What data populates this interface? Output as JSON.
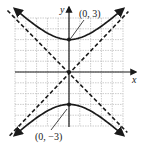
{
  "chart_data": {
    "type": "line",
    "title": "",
    "xlabel": "x",
    "ylabel": "y",
    "xlim": [
      -5,
      5
    ],
    "ylim": [
      -5,
      5
    ],
    "grid": true,
    "equation": "y^2/9 - x^2/9 = 1",
    "series": [
      {
        "name": "upper-branch",
        "style": "solid",
        "function": "y = sqrt(9 + x^2)",
        "x_range": [
          -5,
          5
        ]
      },
      {
        "name": "lower-branch",
        "style": "solid",
        "function": "y = -sqrt(9 + x^2)",
        "x_range": [
          -5,
          5
        ]
      },
      {
        "name": "asymptote-positive",
        "style": "dashed",
        "function": "y = x"
      },
      {
        "name": "asymptote-negative",
        "style": "dashed",
        "function": "y = -x"
      }
    ],
    "points": [
      {
        "label": "(0, 3)",
        "x": 0,
        "y": 3
      },
      {
        "label": "(0, -3)",
        "x": 0,
        "y": -3
      },
      {
        "label": "",
        "x": 0,
        "y": 0
      }
    ],
    "annotations": [
      "(0, 3)",
      "(0, −3)"
    ]
  },
  "labels": {
    "x_axis": "x",
    "y_axis": "y",
    "vertex_top": "(0, 3)",
    "vertex_bottom": "(0, −3)"
  },
  "colors": {
    "curve": "#1a1a1a",
    "grid": "#b8b8b8",
    "background": "#ffffff"
  }
}
